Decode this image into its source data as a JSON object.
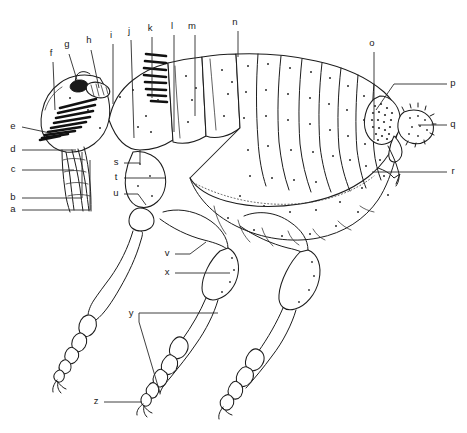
{
  "figure": {
    "view": "lateral",
    "style": "line drawing, black ink on white",
    "background_color": "#ffffff",
    "ink_color": "#1c1c1c",
    "width": 467,
    "height": 433
  },
  "labels": [
    {
      "id": "a",
      "text": "a",
      "x": 13,
      "y": 212,
      "anchor": "left",
      "group": "left-column"
    },
    {
      "id": "b",
      "text": "b",
      "x": 13,
      "y": 200,
      "anchor": "left",
      "group": "left-column"
    },
    {
      "id": "c",
      "text": "c",
      "x": 13,
      "y": 172,
      "anchor": "left",
      "group": "left-column"
    },
    {
      "id": "d",
      "text": "d",
      "x": 13,
      "y": 152,
      "anchor": "left",
      "group": "left-column"
    },
    {
      "id": "e",
      "text": "e",
      "x": 13,
      "y": 129,
      "anchor": "left",
      "group": "left-column"
    },
    {
      "id": "f",
      "text": "f",
      "x": 51,
      "y": 56,
      "anchor": "top",
      "group": "top-row"
    },
    {
      "id": "g",
      "text": "g",
      "x": 67,
      "y": 47,
      "anchor": "top",
      "group": "top-row"
    },
    {
      "id": "h",
      "text": "h",
      "x": 89,
      "y": 43,
      "anchor": "top",
      "group": "top-row"
    },
    {
      "id": "i",
      "text": "i",
      "x": 111,
      "y": 38,
      "anchor": "top",
      "group": "top-row"
    },
    {
      "id": "j",
      "text": "j",
      "x": 129,
      "y": 34,
      "anchor": "top",
      "group": "top-row"
    },
    {
      "id": "k",
      "text": "k",
      "x": 150,
      "y": 31,
      "anchor": "top",
      "group": "top-row"
    },
    {
      "id": "l",
      "text": "l",
      "x": 172,
      "y": 29,
      "anchor": "top",
      "group": "top-row"
    },
    {
      "id": "m",
      "text": "m",
      "x": 192,
      "y": 29,
      "anchor": "top",
      "group": "top-row"
    },
    {
      "id": "n",
      "text": "n",
      "x": 235,
      "y": 25,
      "anchor": "top",
      "group": "top-row"
    },
    {
      "id": "o",
      "text": "o",
      "x": 372,
      "y": 46,
      "anchor": "top",
      "group": "right-column"
    },
    {
      "id": "p",
      "text": "p",
      "x": 453,
      "y": 86,
      "anchor": "right",
      "group": "right-column"
    },
    {
      "id": "q",
      "text": "q",
      "x": 453,
      "y": 127,
      "anchor": "right",
      "group": "right-column"
    },
    {
      "id": "r",
      "text": "r",
      "x": 453,
      "y": 174,
      "anchor": "right",
      "group": "right-column"
    },
    {
      "id": "s",
      "text": "s",
      "x": 116,
      "y": 165,
      "anchor": "left",
      "group": "middle"
    },
    {
      "id": "t",
      "text": "t",
      "x": 116,
      "y": 180,
      "anchor": "left",
      "group": "middle"
    },
    {
      "id": "u",
      "text": "u",
      "x": 116,
      "y": 196,
      "anchor": "left",
      "group": "middle"
    },
    {
      "id": "v",
      "text": "v",
      "x": 167,
      "y": 256,
      "anchor": "left",
      "group": "legs"
    },
    {
      "id": "x",
      "text": "x",
      "x": 167,
      "y": 275,
      "anchor": "left",
      "group": "legs"
    },
    {
      "id": "y",
      "text": "y",
      "x": 131,
      "y": 316,
      "anchor": "left",
      "group": "legs"
    },
    {
      "id": "z",
      "text": "z",
      "x": 96,
      "y": 404,
      "anchor": "left",
      "group": "legs"
    }
  ],
  "body_parts": {
    "head": "head capsule with eye, antenna and genal comb",
    "comb_genal": "genal ctenidium (row of spines below eye)",
    "comb_pronotal": "pronotal ctenidium (vertical row of spines)",
    "thorax": "three thoracic segments",
    "abdomen": "segmented abdomen with stippled terga",
    "legs": "three pairs of legs with coxa, femur, tibia and five-segmented tarsi ending in claws",
    "sensilium": "sensilium / pygidium at rear dorsum"
  },
  "counts": {
    "genal_comb_spines": 9,
    "pronotal_comb_spines": 8,
    "abdominal_segments": 8,
    "tarsal_segments": 5,
    "total_labels": 26
  }
}
